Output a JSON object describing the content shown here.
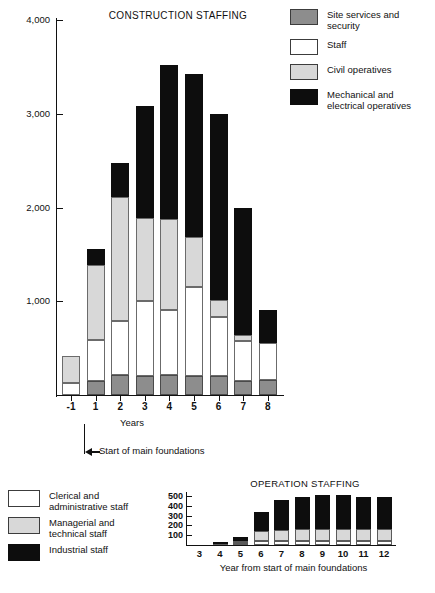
{
  "chart_data": [
    {
      "type": "bar",
      "title": "CONSTRUCTION STAFFING",
      "xlabel": "Years",
      "ylabel": "",
      "stacked": true,
      "grid": false,
      "legend_position": "right",
      "ylim": [
        0,
        4000
      ],
      "yticks": [
        0,
        1000,
        2000,
        3000,
        4000
      ],
      "ytick_labels": [
        "",
        "1,000",
        "2,000",
        "3,000",
        "4,000"
      ],
      "categories": [
        "-1",
        "1",
        "2",
        "3",
        "4",
        "5",
        "6",
        "7",
        "8"
      ],
      "series": [
        {
          "name": "Site services and security",
          "color": "#8d8d8d",
          "values": [
            0,
            150,
            210,
            200,
            210,
            200,
            200,
            150,
            160
          ]
        },
        {
          "name": "Staff",
          "color": "#ffffff",
          "values": [
            130,
            440,
            580,
            800,
            700,
            950,
            630,
            430,
            400
          ]
        },
        {
          "name": "Civil operatives",
          "color": "#d8d8d8",
          "values": [
            290,
            800,
            1320,
            890,
            970,
            540,
            180,
            60,
            0
          ]
        },
        {
          "name": "Mechanical and electrical operatives",
          "color": "#0d0d0d",
          "values": [
            0,
            170,
            370,
            1190,
            1640,
            1730,
            1990,
            1360,
            350
          ]
        }
      ],
      "totals": [
        420,
        1560,
        2480,
        3080,
        3520,
        3420,
        3000,
        2000,
        910
      ],
      "annotation": {
        "text": "Start of main foundations",
        "at_category": "1"
      }
    },
    {
      "type": "bar",
      "title": "OPERATION STAFFING",
      "xlabel": "Year from start of main foundations",
      "ylabel": "",
      "stacked": true,
      "grid": false,
      "legend_position": "left",
      "ylim": [
        0,
        500
      ],
      "yticks": [
        100,
        200,
        300,
        400,
        500
      ],
      "ytick_labels": [
        "100",
        "200",
        "300",
        "400",
        "500"
      ],
      "categories": [
        "3",
        "4",
        "5",
        "6",
        "7",
        "8",
        "9",
        "10",
        "11",
        "12"
      ],
      "series": [
        {
          "name": "Clerical and administrative staff",
          "color": "#ffffff",
          "values": [
            0,
            5,
            20,
            40,
            45,
            45,
            45,
            45,
            45,
            45
          ]
        },
        {
          "name": "Managerial and technical staff",
          "color": "#d8d8d8",
          "values": [
            0,
            5,
            25,
            105,
            110,
            115,
            120,
            120,
            115,
            115
          ]
        },
        {
          "name": "Industrial staff",
          "color": "#0d0d0d",
          "values": [
            0,
            15,
            35,
            195,
            305,
            330,
            350,
            350,
            325,
            325
          ]
        }
      ],
      "totals": [
        0,
        25,
        80,
        340,
        460,
        490,
        515,
        515,
        485,
        485
      ]
    }
  ],
  "upper": {
    "title": "CONSTRUCTION STAFFING",
    "xaxis_title": "Years",
    "ytick_labels": [
      "4,000",
      "3,000",
      "2,000",
      "1,000"
    ],
    "xtick_labels": [
      "-1",
      "1",
      "2",
      "3",
      "4",
      "5",
      "6",
      "7",
      "8"
    ],
    "annotation": "Start of main foundations",
    "legend": [
      {
        "label_line1": "Site services and",
        "label_line2": "security",
        "swatch": "site-services-swatch"
      },
      {
        "label_line1": "Staff",
        "label_line2": "",
        "swatch": "staff-swatch"
      },
      {
        "label_line1": "Civil operatives",
        "label_line2": "",
        "swatch": "civil-operatives-swatch"
      },
      {
        "label_line1": "Mechanical and",
        "label_line2": "electrical operatives",
        "swatch": "mechanical-electrical-swatch"
      }
    ]
  },
  "lower": {
    "title": "OPERATION STAFFING",
    "xaxis_title": "Year from start of main foundations",
    "ytick_labels": [
      "500",
      "400",
      "300",
      "200",
      "100"
    ],
    "xtick_labels": [
      "3",
      "4",
      "5",
      "6",
      "7",
      "8",
      "9",
      "10",
      "11",
      "12"
    ],
    "legend": [
      {
        "label_line1": "Clerical and",
        "label_line2": "administrative staff",
        "swatch": "clerical-admin-swatch"
      },
      {
        "label_line1": "Managerial and",
        "label_line2": "technical staff",
        "swatch": "managerial-technical-swatch"
      },
      {
        "label_line1": "Industrial staff",
        "label_line2": "",
        "swatch": "industrial-staff-swatch"
      }
    ]
  },
  "colors": {
    "site_services": "#8d8d8d",
    "staff": "#ffffff",
    "civil_operatives": "#d8d8d8",
    "mechanical_electrical": "#0d0d0d",
    "clerical": "#ffffff",
    "managerial": "#d8d8d8",
    "industrial": "#0d0d0d",
    "axis": "#111111"
  }
}
